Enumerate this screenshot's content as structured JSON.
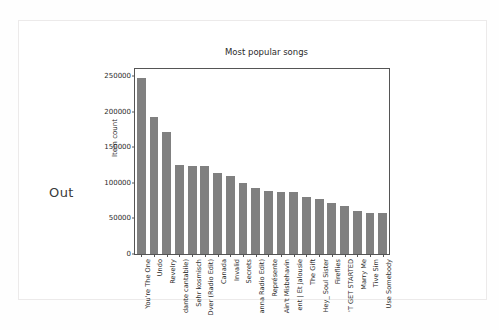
{
  "document": {
    "margin_label": "Out"
  },
  "chart_data": {
    "type": "bar",
    "title": "Most popular songs",
    "xlabel": "",
    "ylabel": "Item count",
    "ylim": [
      0,
      260000
    ],
    "yticks": [
      0,
      50000,
      100000,
      150000,
      200000,
      250000
    ],
    "ytick_labels": [
      "0",
      "50000",
      "100000",
      "150000",
      "200000",
      "250000"
    ],
    "grid": false,
    "legend": null,
    "bar_color": "#808080",
    "categories": [
      "You're The One",
      "Undo",
      "Revelry",
      "dante cantabile)",
      "Sehr kosmisch",
      "Dver (Radio Edit)",
      "Canada",
      "Invalid",
      "Secrets",
      "anna Radio Edit)",
      "Représente",
      "Ain't Misbehavin",
      "ent | Et Jalousie",
      "The Gift",
      "Hey_ Soul Sister",
      "Fireflies",
      "'T GET STARTED",
      "Marry Me",
      "Tive Sim",
      "Use Somebody"
    ],
    "values": [
      248000,
      192000,
      172000,
      125000,
      124000,
      124000,
      114000,
      109000,
      100000,
      93000,
      88000,
      87000,
      87000,
      80000,
      77000,
      71000,
      68000,
      61000,
      57000,
      57000
    ]
  }
}
